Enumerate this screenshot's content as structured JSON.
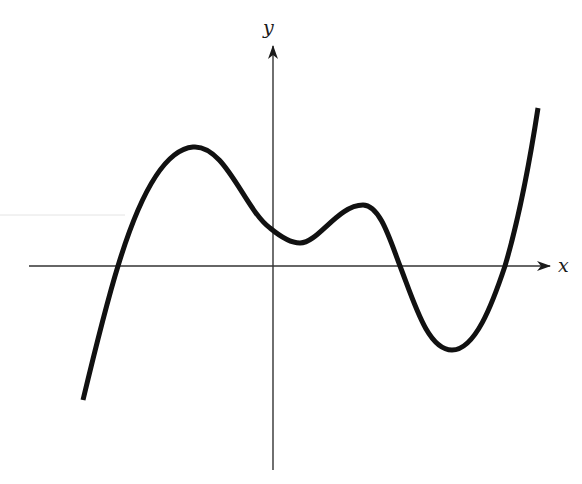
{
  "figure": {
    "type": "function-graph",
    "background": "#ffffff",
    "axis_color": "#333333",
    "curve_color": "#111111",
    "x_axis": {
      "label": "x",
      "y_px": 266,
      "x_start_px": 29,
      "x_end_px": 551
    },
    "y_axis": {
      "label": "y",
      "x_px": 273,
      "y_start_px": 470,
      "y_end_px": 45
    },
    "curve": {
      "description": "Smooth curve: rises from lower-left, crosses x-axis, reaches a high local maximum left of the y-axis, dips to a local minimum just right of the y-axis (above the x-axis), rises to a smaller local maximum, falls below the x-axis to a local minimum, then rises steeply past the x-axis to the upper right.",
      "key_points_px": [
        {
          "label": "start",
          "x": 83,
          "y": 400
        },
        {
          "label": "x-intercept-1",
          "x": 118,
          "y": 266
        },
        {
          "label": "local-max-1",
          "x": 193,
          "y": 147
        },
        {
          "label": "local-min-1",
          "x": 300,
          "y": 243
        },
        {
          "label": "local-max-2",
          "x": 363,
          "y": 205
        },
        {
          "label": "x-intercept-2",
          "x": 400,
          "y": 266
        },
        {
          "label": "local-min-2",
          "x": 452,
          "y": 350
        },
        {
          "label": "x-intercept-3",
          "x": 505,
          "y": 266
        },
        {
          "label": "end",
          "x": 538,
          "y": 108
        }
      ]
    }
  }
}
